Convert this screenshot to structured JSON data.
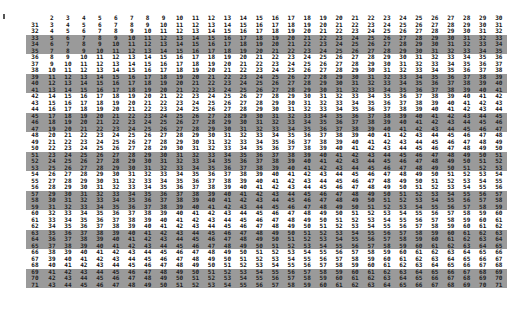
{
  "table": {
    "header": [
      "",
      "2",
      "3",
      "4",
      "5",
      "6",
      "7",
      "8",
      "9",
      "10",
      "11",
      "12",
      "13",
      "14",
      "15",
      "16",
      "17",
      "18",
      "19",
      "20",
      "21",
      "22",
      "23",
      "24",
      "25",
      "26",
      "27",
      "28",
      "29",
      "30"
    ],
    "shading": {
      "color": "#9a9a9a",
      "shaded_rows": [
        33,
        34,
        35,
        39,
        40,
        41,
        45,
        46,
        47,
        51,
        52,
        53,
        57,
        58,
        59,
        63,
        64,
        65,
        69,
        70,
        71
      ]
    },
    "rows": [
      [
        "31",
        "3",
        "4",
        "5",
        "6",
        "7",
        "8",
        "9",
        "10",
        "11",
        "12",
        "13",
        "14",
        "15",
        "16",
        "17",
        "18",
        "19",
        "20",
        "21",
        "22",
        "23",
        "24",
        "25",
        "26",
        "27",
        "28",
        "29",
        "30",
        "31"
      ],
      [
        "32",
        "4",
        "5",
        "6",
        "7",
        "8",
        "9",
        "10",
        "11",
        "12",
        "13",
        "14",
        "15",
        "16",
        "17",
        "18",
        "19",
        "20",
        "21",
        "22",
        "23",
        "24",
        "25",
        "26",
        "27",
        "28",
        "29",
        "30",
        "31",
        "32"
      ],
      [
        "33",
        "5",
        "6",
        "7",
        "8",
        "9",
        "10",
        "11",
        "12",
        "13",
        "14",
        "15",
        "16",
        "17",
        "18",
        "19",
        "20",
        "21",
        "22",
        "23",
        "24",
        "25",
        "26",
        "27",
        "28",
        "29",
        "30",
        "31",
        "32",
        "33"
      ],
      [
        "34",
        "6",
        "7",
        "8",
        "9",
        "10",
        "11",
        "12",
        "13",
        "14",
        "15",
        "16",
        "17",
        "18",
        "19",
        "20",
        "21",
        "22",
        "23",
        "24",
        "25",
        "26",
        "27",
        "28",
        "29",
        "30",
        "31",
        "32",
        "33",
        "34"
      ],
      [
        "35",
        "7",
        "8",
        "9",
        "10",
        "11",
        "12",
        "13",
        "14",
        "15",
        "16",
        "17",
        "18",
        "19",
        "20",
        "21",
        "22",
        "23",
        "24",
        "25",
        "26",
        "27",
        "28",
        "29",
        "30",
        "31",
        "32",
        "33",
        "34",
        "35"
      ],
      [
        "36",
        "8",
        "9",
        "10",
        "11",
        "12",
        "13",
        "14",
        "15",
        "16",
        "17",
        "18",
        "19",
        "20",
        "21",
        "22",
        "23",
        "24",
        "25",
        "26",
        "27",
        "28",
        "29",
        "30",
        "31",
        "32",
        "33",
        "34",
        "35",
        "36"
      ],
      [
        "37",
        "9",
        "10",
        "11",
        "12",
        "13",
        "14",
        "15",
        "16",
        "17",
        "18",
        "19",
        "20",
        "21",
        "22",
        "23",
        "24",
        "25",
        "26",
        "27",
        "28",
        "29",
        "30",
        "31",
        "32",
        "33",
        "34",
        "35",
        "36",
        "37"
      ],
      [
        "38",
        "10",
        "11",
        "12",
        "13",
        "14",
        "15",
        "16",
        "17",
        "18",
        "19",
        "20",
        "21",
        "22",
        "23",
        "24",
        "25",
        "26",
        "27",
        "28",
        "29",
        "30",
        "31",
        "32",
        "33",
        "34",
        "35",
        "36",
        "37",
        "38"
      ],
      [
        "39",
        "11",
        "12",
        "13",
        "14",
        "15",
        "16",
        "17",
        "18",
        "19",
        "20",
        "21",
        "22",
        "23",
        "24",
        "25",
        "26",
        "27",
        "28",
        "29",
        "30",
        "31",
        "32",
        "33",
        "34",
        "35",
        "36",
        "37",
        "38",
        "39"
      ],
      [
        "40",
        "12",
        "13",
        "14",
        "15",
        "16",
        "17",
        "18",
        "19",
        "20",
        "21",
        "22",
        "23",
        "24",
        "25",
        "26",
        "27",
        "28",
        "29",
        "30",
        "31",
        "32",
        "33",
        "34",
        "35",
        "36",
        "37",
        "38",
        "39",
        "40"
      ],
      [
        "41",
        "13",
        "14",
        "15",
        "16",
        "17",
        "18",
        "19",
        "20",
        "21",
        "22",
        "23",
        "24",
        "25",
        "26",
        "27",
        "28",
        "29",
        "30",
        "31",
        "32",
        "33",
        "34",
        "35",
        "36",
        "37",
        "38",
        "39",
        "40",
        "41"
      ],
      [
        "42",
        "14",
        "15",
        "16",
        "17",
        "18",
        "19",
        "20",
        "21",
        "22",
        "23",
        "24",
        "25",
        "26",
        "27",
        "28",
        "29",
        "30",
        "31",
        "32",
        "33",
        "34",
        "35",
        "36",
        "37",
        "38",
        "39",
        "40",
        "41",
        "42"
      ],
      [
        "43",
        "15",
        "16",
        "17",
        "18",
        "19",
        "20",
        "21",
        "22",
        "23",
        "24",
        "25",
        "26",
        "27",
        "28",
        "29",
        "30",
        "31",
        "32",
        "33",
        "34",
        "35",
        "36",
        "37",
        "38",
        "39",
        "40",
        "41",
        "42",
        "43"
      ],
      [
        "44",
        "16",
        "17",
        "18",
        "19",
        "20",
        "21",
        "22",
        "23",
        "24",
        "25",
        "26",
        "27",
        "28",
        "29",
        "30",
        "31",
        "32",
        "33",
        "34",
        "35",
        "36",
        "37",
        "38",
        "39",
        "40",
        "41",
        "42",
        "43",
        "44"
      ],
      [
        "45",
        "17",
        "18",
        "19",
        "20",
        "21",
        "22",
        "23",
        "24",
        "25",
        "26",
        "27",
        "28",
        "29",
        "30",
        "31",
        "32",
        "33",
        "34",
        "35",
        "36",
        "37",
        "38",
        "39",
        "40",
        "41",
        "42",
        "43",
        "44",
        "45"
      ],
      [
        "46",
        "18",
        "19",
        "20",
        "21",
        "22",
        "23",
        "24",
        "25",
        "26",
        "27",
        "28",
        "29",
        "30",
        "31",
        "32",
        "33",
        "34",
        "35",
        "36",
        "37",
        "38",
        "39",
        "40",
        "41",
        "42",
        "43",
        "44",
        "45",
        "46"
      ],
      [
        "47",
        "19",
        "20",
        "21",
        "22",
        "23",
        "24",
        "25",
        "26",
        "27",
        "28",
        "29",
        "30",
        "31",
        "32",
        "33",
        "34",
        "35",
        "36",
        "37",
        "38",
        "39",
        "40",
        "41",
        "42",
        "43",
        "44",
        "45",
        "46",
        "47"
      ],
      [
        "48",
        "20",
        "21",
        "22",
        "23",
        "24",
        "25",
        "26",
        "27",
        "28",
        "29",
        "30",
        "31",
        "32",
        "33",
        "34",
        "35",
        "36",
        "37",
        "38",
        "39",
        "40",
        "41",
        "42",
        "43",
        "44",
        "45",
        "46",
        "47",
        "48"
      ],
      [
        "49",
        "21",
        "22",
        "23",
        "24",
        "25",
        "26",
        "27",
        "28",
        "29",
        "30",
        "31",
        "32",
        "33",
        "34",
        "35",
        "36",
        "37",
        "38",
        "39",
        "40",
        "41",
        "42",
        "43",
        "44",
        "45",
        "46",
        "47",
        "48",
        "49"
      ],
      [
        "50",
        "22",
        "23",
        "24",
        "25",
        "26",
        "27",
        "28",
        "29",
        "30",
        "31",
        "32",
        "33",
        "34",
        "35",
        "36",
        "37",
        "38",
        "39",
        "40",
        "41",
        "42",
        "43",
        "44",
        "45",
        "46",
        "47",
        "48",
        "49",
        "50"
      ],
      [
        "51",
        "23",
        "24",
        "25",
        "26",
        "27",
        "28",
        "29",
        "30",
        "31",
        "32",
        "33",
        "34",
        "35",
        "36",
        "37",
        "38",
        "39",
        "40",
        "41",
        "42",
        "43",
        "44",
        "45",
        "46",
        "47",
        "48",
        "49",
        "50",
        "51"
      ],
      [
        "52",
        "24",
        "25",
        "26",
        "27",
        "28",
        "29",
        "30",
        "31",
        "32",
        "33",
        "34",
        "35",
        "36",
        "37",
        "38",
        "39",
        "40",
        "41",
        "42",
        "43",
        "44",
        "45",
        "46",
        "47",
        "48",
        "49",
        "50",
        "51",
        "52"
      ],
      [
        "53",
        "25",
        "26",
        "27",
        "28",
        "29",
        "30",
        "31",
        "32",
        "33",
        "34",
        "35",
        "36",
        "37",
        "38",
        "39",
        "40",
        "41",
        "42",
        "43",
        "44",
        "45",
        "46",
        "47",
        "48",
        "49",
        "50",
        "51",
        "52",
        "53"
      ],
      [
        "54",
        "26",
        "27",
        "28",
        "29",
        "30",
        "31",
        "32",
        "33",
        "34",
        "35",
        "36",
        "37",
        "38",
        "39",
        "40",
        "41",
        "42",
        "43",
        "44",
        "45",
        "46",
        "47",
        "48",
        "49",
        "50",
        "51",
        "52",
        "53",
        "54"
      ],
      [
        "55",
        "27",
        "28",
        "29",
        "30",
        "31",
        "32",
        "33",
        "34",
        "35",
        "36",
        "37",
        "38",
        "39",
        "40",
        "41",
        "42",
        "43",
        "44",
        "45",
        "46",
        "47",
        "48",
        "49",
        "50",
        "51",
        "52",
        "53",
        "54",
        "55"
      ],
      [
        "56",
        "28",
        "29",
        "30",
        "31",
        "32",
        "33",
        "34",
        "35",
        "36",
        "37",
        "38",
        "39",
        "40",
        "41",
        "42",
        "43",
        "44",
        "45",
        "46",
        "47",
        "48",
        "49",
        "50",
        "51",
        "52",
        "53",
        "54",
        "55",
        "56"
      ],
      [
        "57",
        "29",
        "30",
        "31",
        "32",
        "33",
        "34",
        "35",
        "36",
        "37",
        "38",
        "39",
        "40",
        "41",
        "42",
        "43",
        "44",
        "45",
        "46",
        "47",
        "48",
        "49",
        "50",
        "51",
        "52",
        "53",
        "54",
        "55",
        "56",
        "57"
      ],
      [
        "58",
        "30",
        "31",
        "32",
        "33",
        "34",
        "35",
        "36",
        "37",
        "38",
        "39",
        "40",
        "41",
        "42",
        "43",
        "44",
        "45",
        "46",
        "47",
        "48",
        "49",
        "50",
        "51",
        "52",
        "53",
        "54",
        "55",
        "56",
        "57",
        "58"
      ],
      [
        "59",
        "31",
        "32",
        "33",
        "34",
        "35",
        "36",
        "37",
        "38",
        "39",
        "40",
        "41",
        "42",
        "43",
        "44",
        "45",
        "46",
        "47",
        "48",
        "49",
        "50",
        "51",
        "52",
        "53",
        "54",
        "55",
        "56",
        "57",
        "58",
        "59"
      ],
      [
        "60",
        "32",
        "33",
        "34",
        "35",
        "36",
        "37",
        "38",
        "39",
        "40",
        "41",
        "42",
        "43",
        "44",
        "45",
        "46",
        "47",
        "48",
        "49",
        "50",
        "51",
        "52",
        "53",
        "54",
        "55",
        "56",
        "57",
        "58",
        "59",
        "60"
      ],
      [
        "61",
        "33",
        "34",
        "35",
        "36",
        "37",
        "38",
        "39",
        "40",
        "41",
        "42",
        "43",
        "44",
        "45",
        "46",
        "47",
        "48",
        "49",
        "50",
        "51",
        "52",
        "53",
        "54",
        "55",
        "56",
        "57",
        "58",
        "59",
        "60",
        "61"
      ],
      [
        "62",
        "34",
        "35",
        "36",
        "37",
        "38",
        "39",
        "40",
        "41",
        "42",
        "43",
        "44",
        "45",
        "46",
        "47",
        "48",
        "49",
        "50",
        "51",
        "52",
        "53",
        "54",
        "55",
        "56",
        "57",
        "58",
        "59",
        "60",
        "61",
        "62"
      ],
      [
        "63",
        "35",
        "36",
        "37",
        "38",
        "39",
        "40",
        "41",
        "42",
        "43",
        "44",
        "45",
        "46",
        "47",
        "48",
        "49",
        "50",
        "51",
        "52",
        "53",
        "54",
        "55",
        "56",
        "57",
        "58",
        "59",
        "60",
        "61",
        "62",
        "63"
      ],
      [
        "64",
        "36",
        "37",
        "38",
        "39",
        "40",
        "41",
        "42",
        "43",
        "44",
        "45",
        "46",
        "47",
        "48",
        "49",
        "50",
        "51",
        "52",
        "53",
        "54",
        "55",
        "56",
        "57",
        "58",
        "59",
        "60",
        "61",
        "62",
        "63",
        "64"
      ],
      [
        "65",
        "37",
        "38",
        "39",
        "40",
        "41",
        "42",
        "43",
        "44",
        "45",
        "46",
        "47",
        "48",
        "49",
        "50",
        "51",
        "52",
        "53",
        "54",
        "55",
        "56",
        "57",
        "58",
        "59",
        "60",
        "61",
        "62",
        "63",
        "64",
        "65"
      ],
      [
        "66",
        "38",
        "39",
        "40",
        "41",
        "42",
        "43",
        "44",
        "45",
        "46",
        "47",
        "48",
        "49",
        "50",
        "51",
        "52",
        "53",
        "54",
        "55",
        "56",
        "57",
        "58",
        "59",
        "60",
        "61",
        "62",
        "63",
        "64",
        "65",
        "66"
      ],
      [
        "67",
        "39",
        "40",
        "41",
        "42",
        "43",
        "44",
        "45",
        "46",
        "47",
        "48",
        "49",
        "50",
        "51",
        "52",
        "53",
        "54",
        "55",
        "56",
        "57",
        "58",
        "59",
        "60",
        "61",
        "62",
        "63",
        "64",
        "65",
        "66",
        "67"
      ],
      [
        "68",
        "40",
        "41",
        "42",
        "43",
        "44",
        "45",
        "46",
        "47",
        "48",
        "49",
        "50",
        "51",
        "52",
        "53",
        "54",
        "55",
        "56",
        "57",
        "58",
        "59",
        "60",
        "61",
        "62",
        "63",
        "64",
        "65",
        "66",
        "67",
        "68"
      ],
      [
        "69",
        "41",
        "42",
        "43",
        "44",
        "45",
        "46",
        "47",
        "48",
        "49",
        "50",
        "51",
        "52",
        "53",
        "54",
        "55",
        "56",
        "57",
        "58",
        "59",
        "60",
        "61",
        "62",
        "63",
        "64",
        "65",
        "66",
        "67",
        "68",
        "69"
      ],
      [
        "70",
        "42",
        "43",
        "44",
        "45",
        "46",
        "47",
        "48",
        "49",
        "50",
        "51",
        "52",
        "53",
        "54",
        "55",
        "56",
        "57",
        "58",
        "59",
        "60",
        "61",
        "62",
        "63",
        "64",
        "65",
        "66",
        "67",
        "68",
        "69",
        "70"
      ],
      [
        "71",
        "43",
        "44",
        "45",
        "46",
        "47",
        "48",
        "49",
        "50",
        "51",
        "52",
        "53",
        "54",
        "55",
        "56",
        "57",
        "58",
        "59",
        "60",
        "61",
        "62",
        "63",
        "64",
        "65",
        "66",
        "67",
        "68",
        "69",
        "70",
        "71"
      ]
    ]
  }
}
